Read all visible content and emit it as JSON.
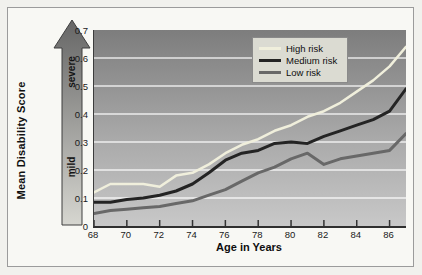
{
  "figure": {
    "y_axis_title": "Mean Disability Score",
    "x_axis_title": "Age in Years",
    "arrow": {
      "top_label": "severe",
      "bottom_label": "mild"
    }
  },
  "chart_data": {
    "type": "line",
    "title": "",
    "xlabel": "Age in Years",
    "ylabel": "Mean Disability Score",
    "xlim": [
      68,
      87
    ],
    "ylim": [
      0,
      0.7
    ],
    "grid": "horizontal white gridlines every 0.1",
    "legend_position": "inside plot, upper center-right",
    "x_tick_labels": [
      "68",
      "70",
      "72",
      "74",
      "76",
      "78",
      "80",
      "82",
      "84",
      "86"
    ],
    "y_tick_labels": [
      "0.7",
      "0.6",
      "0.5",
      "0.4",
      "0.3",
      "0.2",
      "0.1",
      "0"
    ],
    "x": [
      68,
      69,
      70,
      71,
      72,
      73,
      74,
      75,
      76,
      77,
      78,
      79,
      80,
      81,
      82,
      83,
      84,
      85,
      86,
      87
    ],
    "series": [
      {
        "name": "High risk",
        "color": "#f0efdc",
        "width": 2.5,
        "values": [
          0.12,
          0.15,
          0.15,
          0.15,
          0.14,
          0.18,
          0.19,
          0.22,
          0.26,
          0.29,
          0.31,
          0.34,
          0.36,
          0.39,
          0.41,
          0.44,
          0.48,
          0.52,
          0.57,
          0.64
        ]
      },
      {
        "name": "Medium risk",
        "color": "#242424",
        "width": 3,
        "values": [
          0.085,
          0.085,
          0.095,
          0.1,
          0.11,
          0.125,
          0.15,
          0.19,
          0.235,
          0.26,
          0.27,
          0.295,
          0.3,
          0.295,
          0.32,
          0.34,
          0.36,
          0.38,
          0.41,
          0.49
        ]
      },
      {
        "name": "Low risk",
        "color": "#686868",
        "width": 3,
        "values": [
          0.045,
          0.055,
          0.06,
          0.065,
          0.07,
          0.08,
          0.09,
          0.11,
          0.13,
          0.16,
          0.19,
          0.21,
          0.24,
          0.26,
          0.22,
          0.24,
          0.25,
          0.26,
          0.27,
          0.33
        ]
      }
    ]
  },
  "colors": {
    "page_bg": "#f1f1ed",
    "frame_bg": "#f8f8f4",
    "frame_border": "#9b9b9b",
    "plot_bg_top": "#7d7d7d",
    "plot_bg_bottom": "#c8c8c8",
    "gridline": "#ffffff",
    "legend_bg": "#dbdbd2",
    "arrow_dark": "#666666",
    "arrow_light": "#d6d6d0"
  }
}
